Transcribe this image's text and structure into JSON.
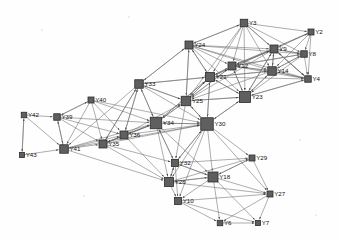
{
  "figure": {
    "type": "network-graph",
    "title": "",
    "background_color": "#fefefe",
    "node_color": "#5f5f5f",
    "node_border_color": "#2b2b2b",
    "edge_color": "#6b6b6b",
    "label_color": "#111111",
    "node_shape": "square",
    "directed": true
  },
  "chart_data": {
    "type": "scatter",
    "title": "",
    "xlabel": "",
    "ylabel": "",
    "layout": "force-directed node-link diagram",
    "node_count": 28,
    "edge_count": 152,
    "nodes": [
      {
        "id": "Y3",
        "label": "Y3",
        "x": 244,
        "y": 23,
        "size": 7.5
      },
      {
        "id": "Y2",
        "label": "Y2",
        "x": 311,
        "y": 32,
        "size": 6.0
      },
      {
        "id": "Y24",
        "label": "Y24",
        "x": 189,
        "y": 45,
        "size": 8.0
      },
      {
        "id": "Y9",
        "label": "Y9",
        "x": 274,
        "y": 49,
        "size": 8.0
      },
      {
        "id": "Y8",
        "label": "Y8",
        "x": 304,
        "y": 54,
        "size": 6.5
      },
      {
        "id": "Y12",
        "label": "Y12",
        "x": 232,
        "y": 66,
        "size": 8.0
      },
      {
        "id": "Y14",
        "label": "Y14",
        "x": 272,
        "y": 71,
        "size": 8.5
      },
      {
        "id": "Y21",
        "label": "Y21",
        "x": 210,
        "y": 77,
        "size": 9.0
      },
      {
        "id": "Y33",
        "label": "Y33",
        "x": 139,
        "y": 84,
        "size": 8.5
      },
      {
        "id": "Y4",
        "label": "Y4",
        "x": 308,
        "y": 79,
        "size": 6.5
      },
      {
        "id": "Y25",
        "label": "Y25",
        "x": 186,
        "y": 101,
        "size": 9.5
      },
      {
        "id": "Y23",
        "label": "Y23",
        "x": 245,
        "y": 97,
        "size": 11.0
      },
      {
        "id": "Y40",
        "label": "Y40",
        "x": 91,
        "y": 100,
        "size": 6.0
      },
      {
        "id": "Y42",
        "label": "Y42",
        "x": 24,
        "y": 115,
        "size": 5.5
      },
      {
        "id": "Y39",
        "label": "Y39",
        "x": 57,
        "y": 117,
        "size": 6.5
      },
      {
        "id": "Y34",
        "label": "Y34",
        "x": 156,
        "y": 123,
        "size": 11.5
      },
      {
        "id": "Y30",
        "label": "Y30",
        "x": 207,
        "y": 124,
        "size": 12.5
      },
      {
        "id": "Y36",
        "label": "Y36",
        "x": 124,
        "y": 135,
        "size": 8.0
      },
      {
        "id": "Y35",
        "label": "Y35",
        "x": 103,
        "y": 144,
        "size": 8.0
      },
      {
        "id": "Y41",
        "label": "Y41",
        "x": 64,
        "y": 149,
        "size": 8.5
      },
      {
        "id": "Y43",
        "label": "Y43",
        "x": 22,
        "y": 155,
        "size": 5.0
      },
      {
        "id": "Y32",
        "label": "Y32",
        "x": 175,
        "y": 163,
        "size": 7.0
      },
      {
        "id": "Y29",
        "label": "Y29",
        "x": 252,
        "y": 158,
        "size": 6.0
      },
      {
        "id": "Y18",
        "label": "Y18",
        "x": 213,
        "y": 177,
        "size": 10.0
      },
      {
        "id": "Y26",
        "label": "Y26",
        "x": 169,
        "y": 182,
        "size": 9.0
      },
      {
        "id": "Y27",
        "label": "Y27",
        "x": 270,
        "y": 194,
        "size": 6.0
      },
      {
        "id": "Y10",
        "label": "Y10",
        "x": 178,
        "y": 201,
        "size": 7.0
      },
      {
        "id": "Y6",
        "label": "Y6",
        "x": 220,
        "y": 223,
        "size": 5.5
      },
      {
        "id": "Y7",
        "label": "Y7",
        "x": 258,
        "y": 223,
        "size": 5.0
      }
    ],
    "edges": [
      [
        "Y3",
        "Y2"
      ],
      [
        "Y3",
        "Y9"
      ],
      [
        "Y3",
        "Y8"
      ],
      [
        "Y3",
        "Y12"
      ],
      [
        "Y3",
        "Y14"
      ],
      [
        "Y3",
        "Y21"
      ],
      [
        "Y3",
        "Y24"
      ],
      [
        "Y3",
        "Y23"
      ],
      [
        "Y3",
        "Y4"
      ],
      [
        "Y3",
        "Y25"
      ],
      [
        "Y24",
        "Y3"
      ],
      [
        "Y24",
        "Y9"
      ],
      [
        "Y24",
        "Y12"
      ],
      [
        "Y24",
        "Y14"
      ],
      [
        "Y24",
        "Y21"
      ],
      [
        "Y24",
        "Y23"
      ],
      [
        "Y24",
        "Y25"
      ],
      [
        "Y24",
        "Y33"
      ],
      [
        "Y24",
        "Y8"
      ],
      [
        "Y24",
        "Y4"
      ],
      [
        "Y2",
        "Y9"
      ],
      [
        "Y2",
        "Y8"
      ],
      [
        "Y2",
        "Y4"
      ],
      [
        "Y2",
        "Y14"
      ],
      [
        "Y2",
        "Y12"
      ],
      [
        "Y9",
        "Y8"
      ],
      [
        "Y9",
        "Y14"
      ],
      [
        "Y9",
        "Y4"
      ],
      [
        "Y9",
        "Y12"
      ],
      [
        "Y9",
        "Y21"
      ],
      [
        "Y9",
        "Y23"
      ],
      [
        "Y9",
        "Y25"
      ],
      [
        "Y9",
        "Y2"
      ],
      [
        "Y8",
        "Y4"
      ],
      [
        "Y8",
        "Y14"
      ],
      [
        "Y8",
        "Y9"
      ],
      [
        "Y8",
        "Y12"
      ],
      [
        "Y8",
        "Y23"
      ],
      [
        "Y12",
        "Y14"
      ],
      [
        "Y12",
        "Y21"
      ],
      [
        "Y12",
        "Y23"
      ],
      [
        "Y12",
        "Y9"
      ],
      [
        "Y12",
        "Y4"
      ],
      [
        "Y12",
        "Y25"
      ],
      [
        "Y12",
        "Y8"
      ],
      [
        "Y14",
        "Y4"
      ],
      [
        "Y14",
        "Y23"
      ],
      [
        "Y14",
        "Y9"
      ],
      [
        "Y14",
        "Y21"
      ],
      [
        "Y14",
        "Y12"
      ],
      [
        "Y14",
        "Y8"
      ],
      [
        "Y14",
        "Y25"
      ],
      [
        "Y21",
        "Y23"
      ],
      [
        "Y21",
        "Y25"
      ],
      [
        "Y21",
        "Y12"
      ],
      [
        "Y21",
        "Y14"
      ],
      [
        "Y21",
        "Y9"
      ],
      [
        "Y21",
        "Y4"
      ],
      [
        "Y21",
        "Y24"
      ],
      [
        "Y21",
        "Y33"
      ],
      [
        "Y21",
        "Y30"
      ],
      [
        "Y21",
        "Y34"
      ],
      [
        "Y4",
        "Y23"
      ],
      [
        "Y4",
        "Y14"
      ],
      [
        "Y4",
        "Y9"
      ],
      [
        "Y23",
        "Y25"
      ],
      [
        "Y23",
        "Y30"
      ],
      [
        "Y23",
        "Y14"
      ],
      [
        "Y23",
        "Y21"
      ],
      [
        "Y23",
        "Y12"
      ],
      [
        "Y23",
        "Y9"
      ],
      [
        "Y23",
        "Y4"
      ],
      [
        "Y25",
        "Y30"
      ],
      [
        "Y25",
        "Y34"
      ],
      [
        "Y25",
        "Y21"
      ],
      [
        "Y25",
        "Y23"
      ],
      [
        "Y25",
        "Y33"
      ],
      [
        "Y25",
        "Y24"
      ],
      [
        "Y25",
        "Y12"
      ],
      [
        "Y25",
        "Y32"
      ],
      [
        "Y33",
        "Y34"
      ],
      [
        "Y33",
        "Y25"
      ],
      [
        "Y33",
        "Y36"
      ],
      [
        "Y33",
        "Y35"
      ],
      [
        "Y33",
        "Y21"
      ],
      [
        "Y33",
        "Y24"
      ],
      [
        "Y33",
        "Y30"
      ],
      [
        "Y33",
        "Y41"
      ],
      [
        "Y40",
        "Y39"
      ],
      [
        "Y40",
        "Y41"
      ],
      [
        "Y40",
        "Y35"
      ],
      [
        "Y40",
        "Y36"
      ],
      [
        "Y40",
        "Y34"
      ],
      [
        "Y40",
        "Y30"
      ],
      [
        "Y42",
        "Y39"
      ],
      [
        "Y42",
        "Y41"
      ],
      [
        "Y42",
        "Y43"
      ],
      [
        "Y39",
        "Y41"
      ],
      [
        "Y39",
        "Y40"
      ],
      [
        "Y39",
        "Y35"
      ],
      [
        "Y39",
        "Y36"
      ],
      [
        "Y39",
        "Y34"
      ],
      [
        "Y43",
        "Y41"
      ],
      [
        "Y43",
        "Y42"
      ],
      [
        "Y41",
        "Y35"
      ],
      [
        "Y41",
        "Y36"
      ],
      [
        "Y41",
        "Y34"
      ],
      [
        "Y41",
        "Y39"
      ],
      [
        "Y41",
        "Y30"
      ],
      [
        "Y41",
        "Y26"
      ],
      [
        "Y35",
        "Y36"
      ],
      [
        "Y35",
        "Y34"
      ],
      [
        "Y35",
        "Y30"
      ],
      [
        "Y35",
        "Y33"
      ],
      [
        "Y35",
        "Y26"
      ],
      [
        "Y35",
        "Y32"
      ],
      [
        "Y36",
        "Y34"
      ],
      [
        "Y36",
        "Y30"
      ],
      [
        "Y36",
        "Y33"
      ],
      [
        "Y36",
        "Y35"
      ],
      [
        "Y36",
        "Y25"
      ],
      [
        "Y36",
        "Y26"
      ],
      [
        "Y34",
        "Y30"
      ],
      [
        "Y34",
        "Y25"
      ],
      [
        "Y34",
        "Y33"
      ],
      [
        "Y34",
        "Y36"
      ],
      [
        "Y34",
        "Y35"
      ],
      [
        "Y34",
        "Y32"
      ],
      [
        "Y34",
        "Y26"
      ],
      [
        "Y34",
        "Y21"
      ],
      [
        "Y34",
        "Y18"
      ],
      [
        "Y30",
        "Y25"
      ],
      [
        "Y30",
        "Y23"
      ],
      [
        "Y30",
        "Y34"
      ],
      [
        "Y30",
        "Y32"
      ],
      [
        "Y30",
        "Y18"
      ],
      [
        "Y30",
        "Y26"
      ],
      [
        "Y30",
        "Y29"
      ],
      [
        "Y30",
        "Y27"
      ],
      [
        "Y30",
        "Y10"
      ],
      [
        "Y30",
        "Y21"
      ],
      [
        "Y32",
        "Y26"
      ],
      [
        "Y32",
        "Y18"
      ],
      [
        "Y32",
        "Y10"
      ],
      [
        "Y32",
        "Y30"
      ],
      [
        "Y32",
        "Y34"
      ],
      [
        "Y32",
        "Y29"
      ],
      [
        "Y26",
        "Y18"
      ],
      [
        "Y26",
        "Y10"
      ],
      [
        "Y26",
        "Y32"
      ],
      [
        "Y26",
        "Y27"
      ],
      [
        "Y26",
        "Y29"
      ],
      [
        "Y18",
        "Y10"
      ],
      [
        "Y18",
        "Y6"
      ],
      [
        "Y18",
        "Y7"
      ],
      [
        "Y18",
        "Y27"
      ],
      [
        "Y18",
        "Y29"
      ],
      [
        "Y18",
        "Y26"
      ],
      [
        "Y18",
        "Y32"
      ],
      [
        "Y10",
        "Y6"
      ],
      [
        "Y10",
        "Y7"
      ],
      [
        "Y10",
        "Y27"
      ],
      [
        "Y29",
        "Y27"
      ],
      [
        "Y29",
        "Y18"
      ],
      [
        "Y27",
        "Y7"
      ],
      [
        "Y27",
        "Y6"
      ],
      [
        "Y6",
        "Y7"
      ]
    ]
  }
}
